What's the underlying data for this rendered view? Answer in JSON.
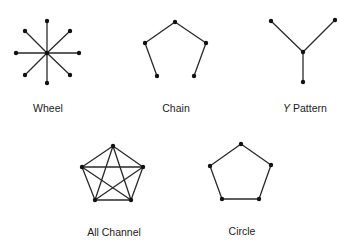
{
  "colors": {
    "background": "#ffffff",
    "edge": "#2a2a2a",
    "node": "#111111",
    "text": "#222222"
  },
  "networks": [
    {
      "id": "wheel",
      "label": "Wheel",
      "label_pos": [
        48,
        112
      ],
      "nodes": [
        [
          47,
          53
        ],
        [
          47,
          21
        ],
        [
          70,
          31
        ],
        [
          79,
          53
        ],
        [
          70,
          75
        ],
        [
          47,
          83
        ],
        [
          25,
          75
        ],
        [
          16,
          53
        ],
        [
          25,
          31
        ]
      ],
      "edges": [
        [
          0,
          1
        ],
        [
          0,
          2
        ],
        [
          0,
          3
        ],
        [
          0,
          4
        ],
        [
          0,
          5
        ],
        [
          0,
          6
        ],
        [
          0,
          7
        ],
        [
          0,
          8
        ]
      ]
    },
    {
      "id": "chain",
      "label": "Chain",
      "label_pos": [
        176,
        112
      ],
      "nodes": [
        [
          157,
          76
        ],
        [
          145,
          43
        ],
        [
          175,
          22
        ],
        [
          206,
          43
        ],
        [
          194,
          76
        ]
      ],
      "edges": [
        [
          0,
          1
        ],
        [
          1,
          2
        ],
        [
          2,
          3
        ],
        [
          3,
          4
        ]
      ]
    },
    {
      "id": "y-pattern",
      "label_prefix": "Y",
      "label_rest": " Pattern",
      "label_pos": [
        305,
        112
      ],
      "nodes": [
        [
          271,
          21
        ],
        [
          335,
          20
        ],
        [
          303,
          52
        ],
        [
          303,
          82
        ]
      ],
      "edges": [
        [
          0,
          2
        ],
        [
          1,
          2
        ],
        [
          2,
          3
        ]
      ]
    },
    {
      "id": "all-channel",
      "label": "All Channel",
      "label_pos": [
        114,
        236
      ],
      "nodes": [
        [
          113,
          146
        ],
        [
          143,
          167
        ],
        [
          131,
          200
        ],
        [
          95,
          200
        ],
        [
          82,
          167
        ]
      ],
      "edges": [
        [
          0,
          1
        ],
        [
          1,
          2
        ],
        [
          2,
          3
        ],
        [
          3,
          4
        ],
        [
          4,
          0
        ],
        [
          0,
          2
        ],
        [
          0,
          3
        ],
        [
          1,
          3
        ],
        [
          1,
          4
        ],
        [
          2,
          4
        ]
      ]
    },
    {
      "id": "circle",
      "label": "Circle",
      "label_pos": [
        242,
        235
      ],
      "nodes": [
        [
          241,
          144
        ],
        [
          271,
          165
        ],
        [
          259,
          199
        ],
        [
          222,
          199
        ],
        [
          210,
          166
        ]
      ],
      "edges": [
        [
          0,
          1
        ],
        [
          1,
          2
        ],
        [
          2,
          3
        ],
        [
          3,
          4
        ],
        [
          4,
          0
        ]
      ]
    }
  ]
}
